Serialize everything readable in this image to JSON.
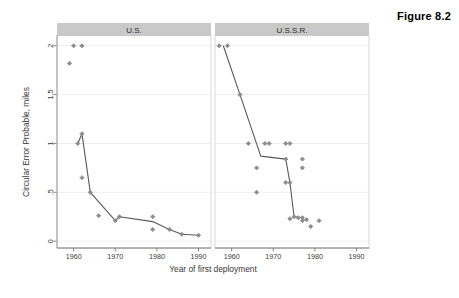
{
  "figure": {
    "label": "Figure 8.2"
  },
  "chart_data": {
    "type": "scatter",
    "title": "",
    "xlabel": "Year of first deployment",
    "ylabel": "Circular Error Probable, miles",
    "xlim": [
      1956,
      1993
    ],
    "ylim": [
      -0.07,
      2.1
    ],
    "xticks": [
      1960,
      1970,
      1980,
      1990
    ],
    "xtick_labels": [
      "1960",
      "1970",
      "1980",
      "1990"
    ],
    "yticks": [
      0,
      0.5,
      1,
      1.5,
      2
    ],
    "ytick_labels": [
      "0",
      ".5",
      "1",
      "1.5",
      "2"
    ],
    "grid": "horizontal",
    "legend": "none",
    "point_color": "#8c8c8c",
    "line_color": "#595959",
    "panels": [
      {
        "label": "U.S.",
        "points": [
          {
            "x": 1959,
            "y": 1.82
          },
          {
            "x": 1960,
            "y": 2.0
          },
          {
            "x": 1962,
            "y": 2.0
          },
          {
            "x": 1961,
            "y": 1.0
          },
          {
            "x": 1962,
            "y": 1.1
          },
          {
            "x": 1962,
            "y": 0.65
          },
          {
            "x": 1964,
            "y": 0.5
          },
          {
            "x": 1966,
            "y": 0.26
          },
          {
            "x": 1970,
            "y": 0.21
          },
          {
            "x": 1971,
            "y": 0.25
          },
          {
            "x": 1979,
            "y": 0.25
          },
          {
            "x": 1979,
            "y": 0.12
          },
          {
            "x": 1983,
            "y": 0.12
          },
          {
            "x": 1986,
            "y": 0.07
          },
          {
            "x": 1990,
            "y": 0.06
          }
        ],
        "trend": [
          {
            "x": 1961,
            "y": 1.0
          },
          {
            "x": 1962,
            "y": 1.1
          },
          {
            "x": 1964,
            "y": 0.5
          },
          {
            "x": 1970,
            "y": 0.21
          },
          {
            "x": 1971,
            "y": 0.25
          },
          {
            "x": 1979,
            "y": 0.2
          },
          {
            "x": 1983,
            "y": 0.12
          },
          {
            "x": 1986,
            "y": 0.07
          },
          {
            "x": 1990,
            "y": 0.06
          }
        ]
      },
      {
        "label": "U.S.S.R.",
        "points": [
          {
            "x": 1957,
            "y": 2.0
          },
          {
            "x": 1959,
            "y": 2.0
          },
          {
            "x": 1962,
            "y": 1.5
          },
          {
            "x": 1964,
            "y": 1.0
          },
          {
            "x": 1968,
            "y": 1.0
          },
          {
            "x": 1969,
            "y": 1.0
          },
          {
            "x": 1973,
            "y": 1.0
          },
          {
            "x": 1974,
            "y": 1.0
          },
          {
            "x": 1966,
            "y": 0.75
          },
          {
            "x": 1966,
            "y": 0.5
          },
          {
            "x": 1973,
            "y": 0.84
          },
          {
            "x": 1977,
            "y": 0.84
          },
          {
            "x": 1977,
            "y": 0.75
          },
          {
            "x": 1973,
            "y": 0.6
          },
          {
            "x": 1974,
            "y": 0.6
          },
          {
            "x": 1974,
            "y": 0.23
          },
          {
            "x": 1975,
            "y": 0.25
          },
          {
            "x": 1976,
            "y": 0.24
          },
          {
            "x": 1977,
            "y": 0.24
          },
          {
            "x": 1977,
            "y": 0.21
          },
          {
            "x": 1978,
            "y": 0.22
          },
          {
            "x": 1979,
            "y": 0.15
          },
          {
            "x": 1981,
            "y": 0.21
          }
        ],
        "trend": [
          {
            "x": 1958,
            "y": 2.0
          },
          {
            "x": 1962,
            "y": 1.5
          },
          {
            "x": 1967,
            "y": 0.87
          },
          {
            "x": 1973,
            "y": 0.84
          },
          {
            "x": 1974,
            "y": 0.6
          },
          {
            "x": 1975,
            "y": 0.25
          },
          {
            "x": 1977,
            "y": 0.24
          }
        ]
      }
    ]
  }
}
